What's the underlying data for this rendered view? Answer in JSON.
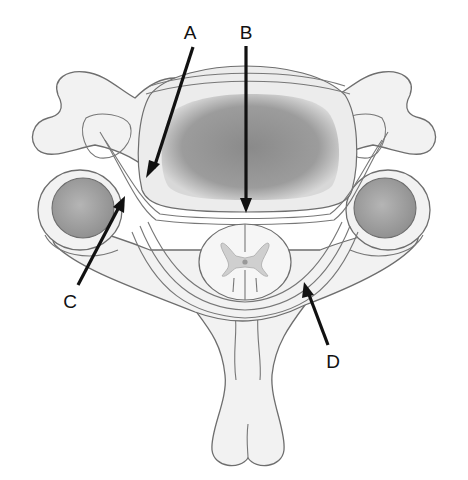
{
  "figure": {
    "labels": [
      {
        "id": "A",
        "text": "A"
      },
      {
        "id": "B",
        "text": "B"
      },
      {
        "id": "C",
        "text": "C"
      },
      {
        "id": "D",
        "text": "D"
      }
    ]
  }
}
